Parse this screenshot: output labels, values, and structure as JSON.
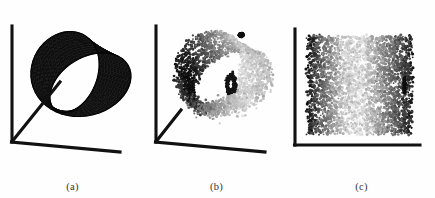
{
  "figure": {
    "background_color": "#fefefe",
    "axis_color": "#111111",
    "panels": [
      {
        "id": "panel-a",
        "caption": "(a)",
        "axes_type": "3d-corner",
        "axes_count": 3,
        "content_name": "mobius-band-mesh-surface",
        "render": "wireframe-mesh",
        "mesh_color": "#141414",
        "fill_color": "#1b1b1b"
      },
      {
        "id": "panel-b",
        "caption": "(b)",
        "axes_type": "3d-corner",
        "axes_count": 3,
        "content_name": "mobius-band-point-cloud",
        "render": "grayscale-scatter",
        "light_color": "#c9c9c9",
        "dark_color": "#1a1a1a"
      },
      {
        "id": "panel-c",
        "caption": "(c)",
        "axes_type": "2d-corner",
        "axes_count": 2,
        "content_name": "unrolled-band-embedding",
        "render": "grayscale-scatter",
        "light_color": "#d8d8d8",
        "dark_color": "#1a1a1a"
      }
    ]
  },
  "chart_data": {
    "type": "scatter",
    "title": "",
    "xlabel": "",
    "ylabel": "",
    "grid": false,
    "legend": "none",
    "panels": [
      {
        "label": "(a)",
        "type": "surface",
        "description": "Mobius-like twisted band rendered as a wireframe mesh on a 3-axis corner frame",
        "u_range": [
          0,
          6.283185
        ],
        "v_range": [
          -1,
          1
        ],
        "u_steps": 48,
        "v_steps": 14
      },
      {
        "label": "(b)",
        "type": "scatter",
        "description": "Noisy grayscale point cloud sampled from the same twisted band in 3D",
        "n_points": 2600,
        "gray_range": [
          0.08,
          0.82
        ]
      },
      {
        "label": "(c)",
        "type": "scatter",
        "description": "Unrolled two-dimensional embedding of the band; grayscale varies with intrinsic coordinate",
        "n_points": 3200,
        "x_range": [
          0,
          1
        ],
        "y_range": [
          0,
          1
        ],
        "gray_range": [
          0.06,
          0.86
        ]
      }
    ]
  }
}
